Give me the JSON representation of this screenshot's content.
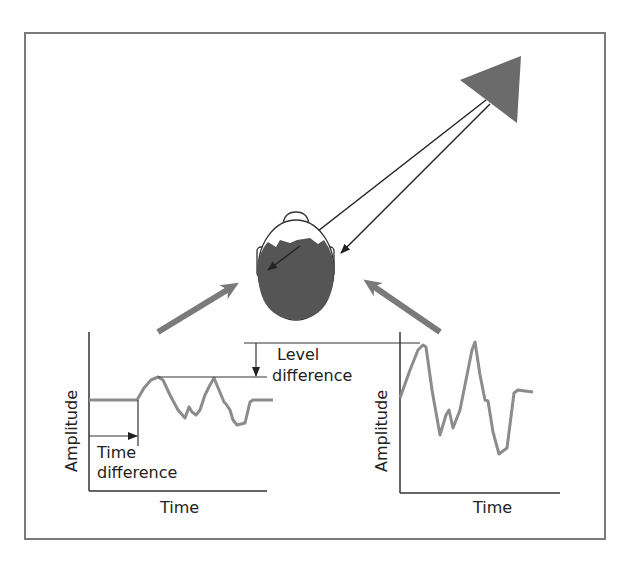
{
  "diagram": {
    "colors": {
      "frame": "#7a7a7a",
      "source": "#6b6b6b",
      "waveform": "#8c8c8c",
      "head_hair": "#555555",
      "big_arrows": "#7a7a7a",
      "lines": "#222222"
    },
    "source": {
      "shape": "triangle",
      "label": ""
    },
    "head": {
      "view": "top-down",
      "icon": "head-top-view"
    },
    "left_plot": {
      "xlabel": "Time",
      "ylabel": "Amplitude",
      "annotation_time": [
        "Time",
        "difference"
      ]
    },
    "right_plot": {
      "xlabel": "Time",
      "ylabel": "Amplitude"
    },
    "level_annotation": [
      "Level",
      "difference"
    ]
  }
}
